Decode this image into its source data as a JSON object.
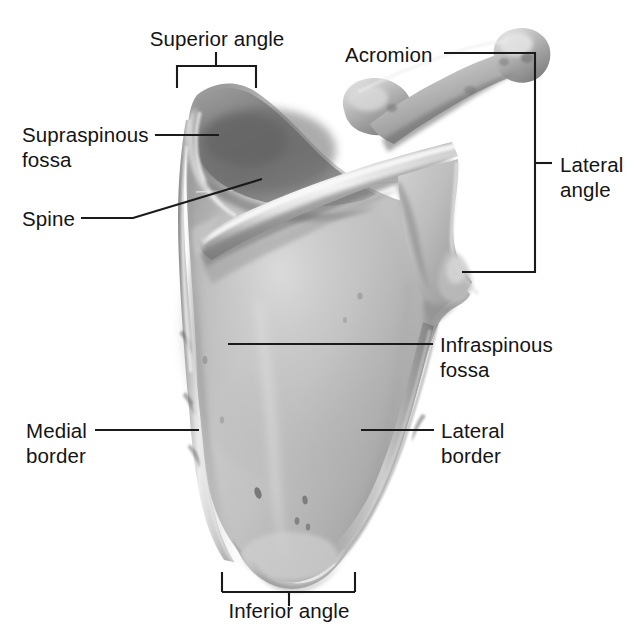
{
  "figure": {
    "background_color": "#ffffff",
    "text_color": "#141414",
    "leader_line_color": "#1a1a1a",
    "bone_tone_light": "#d8d8d8",
    "bone_tone_mid": "#b4b4b4",
    "bone_tone_dark": "#8a8a8a",
    "bone_tone_deep": "#6e6e6e",
    "bone_highlight": "#efefef"
  },
  "labels": {
    "superior_angle": "Superior angle",
    "acromion": "Acromion",
    "supraspinous_fossa_line1": "Supraspinous",
    "supraspinous_fossa_line2": "fossa",
    "spine": "Spine",
    "lateral_angle_line1": "Lateral",
    "lateral_angle_line2": "angle",
    "infraspinous_fossa_line1": "Infraspinous",
    "infraspinous_fossa_line2": "fossa",
    "medial_border_line1": "Medial",
    "medial_border_line2": "border",
    "lateral_border_line1": "Lateral",
    "lateral_border_line2": "border",
    "inferior_angle": "Inferior angle"
  }
}
